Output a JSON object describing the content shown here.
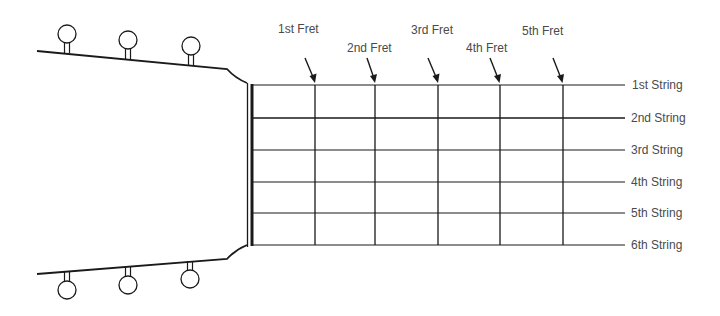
{
  "diagram": {
    "fret_labels": [
      "1st Fret",
      "2nd Fret",
      "3rd Fret",
      "4th Fret",
      "5th Fret"
    ],
    "string_labels": [
      "1st String",
      "2nd String",
      "3rd String",
      "4th String",
      "5th String",
      "6th String"
    ],
    "colors": {
      "ink": "#1a1a1a",
      "text": "#4a4a4a",
      "background": "#ffffff"
    },
    "geometry": {
      "nut_x": 250,
      "string_end_x": 625,
      "fret_x": [
        315,
        375,
        438,
        500,
        563
      ],
      "string_y": [
        85,
        118,
        150,
        182,
        213,
        245
      ],
      "tuning_pegs_top": [
        [
          67,
          34
        ],
        [
          128,
          41
        ],
        [
          191,
          47
        ]
      ],
      "tuning_pegs_bottom": [
        [
          67,
          290
        ],
        [
          128,
          285
        ],
        [
          190,
          279
        ]
      ]
    }
  }
}
